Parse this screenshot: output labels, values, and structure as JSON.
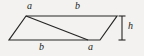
{
  "figure": {
    "kind": "parallelogram-with-diagonal",
    "background_color": "#f3f2f0",
    "stroke_color": "#262626",
    "label_color": "#1b1b1b",
    "shape": {
      "vertices": {
        "top_left": [
          26,
          16
        ],
        "top_right": [
          117,
          16
        ],
        "bottom_right": [
          100,
          40
        ],
        "bottom_left": [
          9,
          40
        ]
      },
      "diagonal": {
        "from": [
          26,
          16
        ],
        "to": [
          88,
          40
        ]
      }
    },
    "height_marker": {
      "x": 122,
      "y_top": 16,
      "y_bottom": 40,
      "cap_half_width": 3.5
    },
    "labels": {
      "a_top": "a",
      "b_top": "b",
      "b_bottom": "b",
      "a_bottom": "a",
      "h": "h"
    }
  }
}
